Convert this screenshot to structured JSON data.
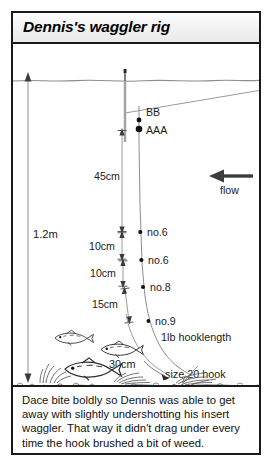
{
  "panel": {
    "title": "Dennis's waggler rig"
  },
  "diagram": {
    "depth_label": "1.2m",
    "flow_label": "flow",
    "flow_icon": "arrow-left-icon",
    "shots": [
      {
        "id": "bb",
        "label": "BB"
      },
      {
        "id": "aaa",
        "label": "AAA"
      },
      {
        "id": "no6a",
        "label": "no.6"
      },
      {
        "id": "no6b",
        "label": "no.6"
      },
      {
        "id": "no8",
        "label": "no.8"
      },
      {
        "id": "no9",
        "label": "no.9"
      }
    ],
    "spacings": [
      {
        "id": "gap-45",
        "label": "45cm"
      },
      {
        "id": "gap-10a",
        "label": "10cm"
      },
      {
        "id": "gap-10b",
        "label": "10cm"
      },
      {
        "id": "gap-15",
        "label": "15cm"
      },
      {
        "id": "gap-30",
        "label": "30cm"
      }
    ],
    "hooklength_label": "1lb hooklength",
    "hook_label": "size 20 hook",
    "colors": {
      "line": "#7a7a7a",
      "ink": "#1a1a1a",
      "water_surface": "#8d8d8d",
      "riverbed": "#555555"
    }
  },
  "caption": {
    "text": "Dace bite boldly so Dennis was able to get away with slightly undershotting his insert waggler. That way it didn't drag under every time the hook brushed a bit of weed."
  }
}
